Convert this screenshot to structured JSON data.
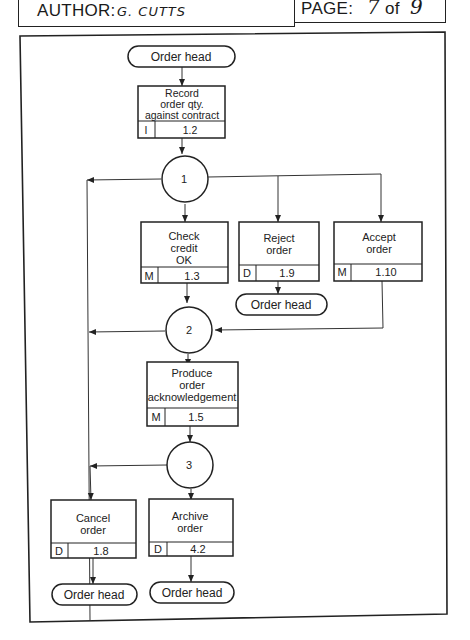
{
  "header": {
    "author_label": "AUTHOR:",
    "author_value": "G. CUTTS",
    "page_label": "PAGE:",
    "page_current": "7",
    "page_of": "of",
    "page_total": "9"
  },
  "diagram": {
    "terminators": {
      "start": "Order head",
      "after_reject": "Order head",
      "after_cancel": "Order head",
      "after_archive": "Order head"
    },
    "processes": {
      "record": {
        "lines": [
          "Record",
          "order qty.",
          "against contract"
        ],
        "type": "I",
        "ref": "1.2"
      },
      "check_credit": {
        "lines": [
          "Check",
          "credit",
          "OK"
        ],
        "type": "M",
        "ref": "1.3"
      },
      "reject": {
        "lines": [
          "Reject",
          "order"
        ],
        "type": "D",
        "ref": "1.9"
      },
      "accept": {
        "lines": [
          "Accept",
          "order"
        ],
        "type": "M",
        "ref": "1.10"
      },
      "produce_ack": {
        "lines": [
          "Produce",
          "order",
          "acknowledgement"
        ],
        "type": "M",
        "ref": "1.5"
      },
      "cancel": {
        "lines": [
          "Cancel",
          "order"
        ],
        "type": "D",
        "ref": "1.8"
      },
      "archive": {
        "lines": [
          "Archive",
          "order"
        ],
        "type": "D",
        "ref": "4.2"
      }
    },
    "connectors": {
      "c1": "1",
      "c2": "2",
      "c3": "3"
    }
  }
}
